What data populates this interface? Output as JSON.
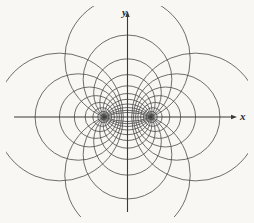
{
  "figure": {
    "background_color": "#f8f7f3",
    "stroke_color": "#4a4a4a",
    "axis_color": "#3a3a3a",
    "width": 254,
    "height": 223
  },
  "axes": {
    "origin_x": 127.5,
    "origin_y": 117,
    "x_label": "x",
    "y_label": "y",
    "x_label_pos": {
      "x": 240,
      "y": 120
    },
    "y_label_pos": {
      "x": 122,
      "y": 16
    },
    "x_axis": {
      "x1": 14,
      "y1": 117,
      "x2": 234,
      "y2": 117
    },
    "y_axis": {
      "x1": 127.5,
      "y1": 14,
      "x2": 127.5,
      "y2": 212
    }
  },
  "chart_data": {
    "type": "diagram",
    "family": "coaxial-circle-system",
    "focus_half_distance": 23.5,
    "foci": [
      {
        "name": "left-focus",
        "x": -23.5,
        "y": 0
      },
      {
        "name": "right-focus",
        "x": 23.5,
        "y": 0
      }
    ],
    "apollonius_circles": {
      "description": "Non-intersecting family: centers on the x-axis at +/-a*cosh(u), radius a/ sinh(u). Each circle encloses exactly one focus.",
      "u_values": [
        0.36,
        0.52,
        0.72,
        0.95,
        1.25,
        1.65,
        2.15,
        2.8
      ],
      "count_per_side": 8
    },
    "coaxal_circles": {
      "description": "Intersecting family: centers on the y-axis at a*cot(v), radius a/ sin(v). Every circle passes through both foci.",
      "v_values_deg": [
        22,
        32,
        44,
        58,
        74,
        90,
        106,
        122,
        136,
        148,
        158
      ],
      "count": 11
    },
    "arc_trim": {
      "description": "Outer members of the intersecting family are drawn as partial arcs, clipped near the plot border.",
      "clip_margin": 6
    }
  },
  "annotations": {
    "caption": ""
  }
}
